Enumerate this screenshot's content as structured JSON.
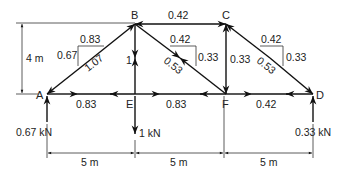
{
  "diagram": {
    "type": "truss",
    "nodes": {
      "A": {
        "label": "A"
      },
      "B": {
        "label": "B"
      },
      "C": {
        "label": "C"
      },
      "D": {
        "label": "D"
      },
      "E": {
        "label": "E"
      },
      "F": {
        "label": "F"
      }
    },
    "members": [
      {
        "id": "AB",
        "from": "A",
        "to": "B",
        "force": "1.07"
      },
      {
        "id": "BC",
        "from": "B",
        "to": "C",
        "force": "0.42"
      },
      {
        "id": "BE",
        "from": "B",
        "to": "E",
        "force": "1"
      },
      {
        "id": "BF",
        "from": "B",
        "to": "F",
        "force": "0.53"
      },
      {
        "id": "CF",
        "from": "C",
        "to": "F",
        "force": "0.33"
      },
      {
        "id": "CD",
        "from": "C",
        "to": "D",
        "force": "0.53"
      },
      {
        "id": "AE",
        "from": "A",
        "to": "E",
        "force": "0.83"
      },
      {
        "id": "EF",
        "from": "E",
        "to": "F",
        "force": "0.83"
      },
      {
        "id": "FD",
        "from": "F",
        "to": "D",
        "force": "0.42"
      }
    ],
    "component_triangles": [
      {
        "member": "AB",
        "horizontal": "0.83",
        "vertical": "0.67",
        "resultant": "1.07"
      },
      {
        "member": "BF",
        "horizontal": "0.42",
        "vertical": "0.33",
        "resultant": "0.53"
      },
      {
        "member": "CD",
        "horizontal": "0.42",
        "vertical": "0.33",
        "resultant": "0.53"
      }
    ],
    "loads": [
      {
        "node": "A",
        "label": "0.67 kN",
        "direction": "up"
      },
      {
        "node": "E",
        "label": "1 kN",
        "direction": "down"
      },
      {
        "node": "D",
        "label": "0.33 kN",
        "direction": "up"
      }
    ],
    "dimensions": {
      "height": "4 m",
      "spans": [
        "5 m",
        "5 m",
        "5 m"
      ]
    }
  }
}
